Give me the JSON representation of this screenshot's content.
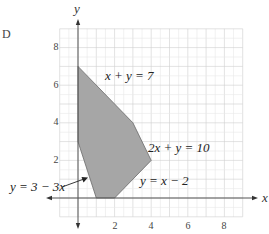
{
  "part_label": "D",
  "chart_data": {
    "type": "area",
    "title": "",
    "xlabel": "x",
    "ylabel": "y",
    "xlim": [
      -1,
      9
    ],
    "ylim": [
      -1,
      9
    ],
    "grid": true,
    "x_ticks": [
      "2",
      "4",
      "6",
      "8"
    ],
    "y_ticks": [
      "2",
      "4",
      "6",
      "8"
    ],
    "feasible_region": {
      "fill": "#a6a6a6",
      "vertices": [
        [
          0,
          7
        ],
        [
          3,
          4
        ],
        [
          4,
          2
        ],
        [
          2,
          0
        ],
        [
          1,
          0
        ],
        [
          0,
          3
        ]
      ]
    },
    "annotations": [
      {
        "text": "x + y = 7",
        "position": [
          1.6,
          6.0
        ]
      },
      {
        "text": "2x + y = 10",
        "position": [
          4.5,
          2.9
        ]
      },
      {
        "text": "y = x − 2",
        "position": [
          3.6,
          0.9
        ]
      },
      {
        "text": "y = 3 − 3x",
        "position": [
          -4.1,
          0.3
        ],
        "arrow_to": [
          0.6,
          1.5
        ]
      }
    ]
  },
  "labels": {
    "x_axis": "x",
    "y_axis": "y",
    "tick_x2": "2",
    "tick_x4": "4",
    "tick_x6": "6",
    "tick_x8": "8",
    "tick_y2": "2",
    "tick_y4": "4",
    "tick_y6": "6",
    "tick_y8": "8",
    "eq1": "x + y = 7",
    "eq2": "2x + y = 10",
    "eq3": "y = x − 2",
    "eq4": "y = 3 − 3x"
  },
  "colors": {
    "region_fill": "#a6a6a6",
    "region_stroke": "#6a6a6a",
    "grid_minor": "#e8e8e8",
    "grid_major": "#cfcfcf",
    "axis": "#555555"
  }
}
